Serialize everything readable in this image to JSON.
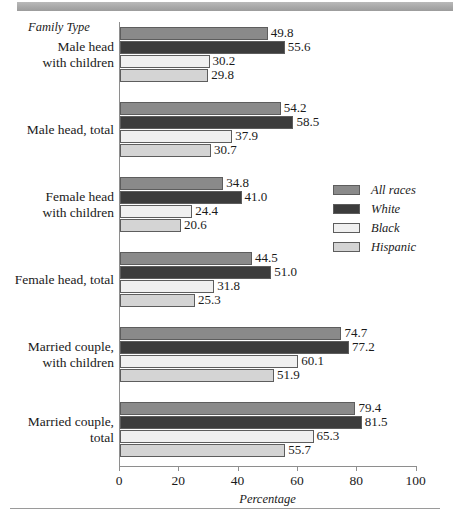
{
  "chart_data": {
    "type": "bar",
    "orientation": "horizontal",
    "title": "",
    "xlabel": "Percentage",
    "ylabel": "Family Type",
    "xlim": [
      0,
      100
    ],
    "xticks": [
      0,
      20,
      40,
      60,
      80,
      100
    ],
    "grid": false,
    "legend_position": "middle-right",
    "categories": [
      "Male head\nwith children",
      "Male head, total",
      "Female head\nwith children",
      "Female head, total",
      "Married couple,\nwith children",
      "Married couple,\ntotal"
    ],
    "series": [
      {
        "name": "All races",
        "color": "#8a8a8a",
        "values": [
          49.8,
          54.2,
          34.8,
          44.5,
          74.7,
          79.4
        ]
      },
      {
        "name": "White",
        "color": "#3c3c3c",
        "values": [
          55.6,
          58.5,
          41.0,
          51.0,
          77.2,
          81.5
        ]
      },
      {
        "name": "Black",
        "color": "#f0f0f0",
        "values": [
          30.2,
          37.9,
          24.4,
          31.8,
          60.1,
          65.3
        ]
      },
      {
        "name": "Hispanic",
        "color": "#d4d4d4",
        "values": [
          29.8,
          30.7,
          20.6,
          25.3,
          51.9,
          55.7
        ]
      }
    ]
  },
  "axis": {
    "y_header": "Family Type",
    "x_title": "Percentage",
    "tick_labels": [
      "0",
      "20",
      "40",
      "60",
      "80",
      "100"
    ]
  },
  "groups": [
    {
      "label_line1": "Male head",
      "label_line2": "with children",
      "bars": [
        {
          "series": "All races",
          "value": "49.8"
        },
        {
          "series": "White",
          "value": "55.6"
        },
        {
          "series": "Black",
          "value": "30.2"
        },
        {
          "series": "Hispanic",
          "value": "29.8"
        }
      ]
    },
    {
      "label_line1": "Male head, total",
      "label_line2": "",
      "bars": [
        {
          "series": "All races",
          "value": "54.2"
        },
        {
          "series": "White",
          "value": "58.5"
        },
        {
          "series": "Black",
          "value": "37.9"
        },
        {
          "series": "Hispanic",
          "value": "30.7"
        }
      ]
    },
    {
      "label_line1": "Female head",
      "label_line2": "with children",
      "bars": [
        {
          "series": "All races",
          "value": "34.8"
        },
        {
          "series": "White",
          "value": "41.0"
        },
        {
          "series": "Black",
          "value": "24.4"
        },
        {
          "series": "Hispanic",
          "value": "20.6"
        }
      ]
    },
    {
      "label_line1": "Female head, total",
      "label_line2": "",
      "bars": [
        {
          "series": "All races",
          "value": "44.5"
        },
        {
          "series": "White",
          "value": "51.0"
        },
        {
          "series": "Black",
          "value": "31.8"
        },
        {
          "series": "Hispanic",
          "value": "25.3"
        }
      ]
    },
    {
      "label_line1": "Married couple,",
      "label_line2": "with children",
      "bars": [
        {
          "series": "All races",
          "value": "74.7"
        },
        {
          "series": "White",
          "value": "77.2"
        },
        {
          "series": "Black",
          "value": "60.1"
        },
        {
          "series": "Hispanic",
          "value": "51.9"
        }
      ]
    },
    {
      "label_line1": "Married couple,",
      "label_line2": "total",
      "bars": [
        {
          "series": "All races",
          "value": "79.4"
        },
        {
          "series": "White",
          "value": "81.5"
        },
        {
          "series": "Black",
          "value": "65.3"
        },
        {
          "series": "Hispanic",
          "value": "55.7"
        }
      ]
    }
  ],
  "legend": {
    "items": [
      {
        "label": "All races",
        "color": "#8a8a8a"
      },
      {
        "label": "White",
        "color": "#3c3c3c"
      },
      {
        "label": "Black",
        "color": "#f0f0f0"
      },
      {
        "label": "Hispanic",
        "color": "#d4d4d4"
      }
    ]
  },
  "colors": {
    "top_band": "#a8a8a8",
    "axis": "#8e8e8e",
    "bar_outline": "#5d5d5d",
    "text": "#1a1a1a"
  }
}
